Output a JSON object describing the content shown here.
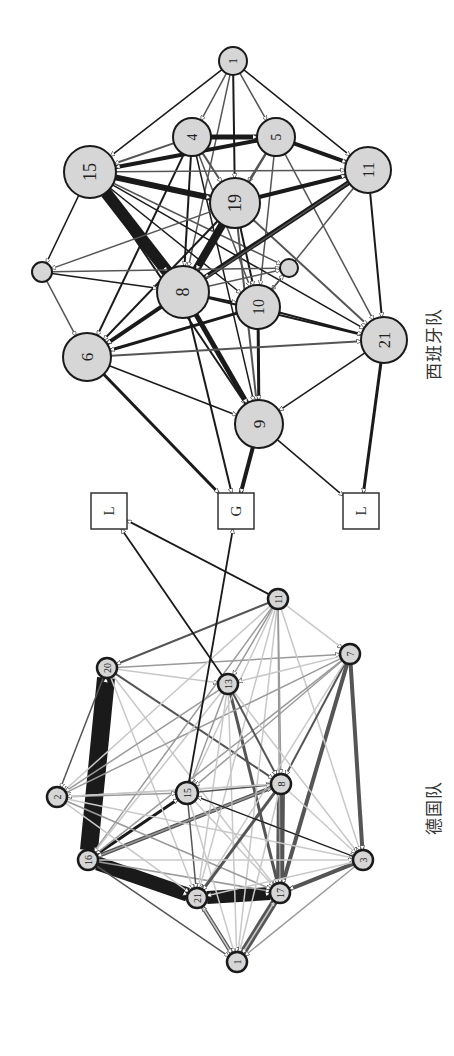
{
  "figure": {
    "orientation": "rotated-90-ccw",
    "colors": {
      "node_fill": "#d6d6d6",
      "node_stroke": "#1a1a1a",
      "box_fill": "#ffffff",
      "edge_dark": "#1a1a1a",
      "edge_mid": "#555555",
      "edge_light": "#9a9a9a",
      "edge_faint": "#c8c8c8"
    }
  },
  "teams": [
    {
      "id": "spain",
      "label": "西班牙队",
      "label_pos": [
        420,
        380
      ],
      "nodes": [
        {
          "id": "s1",
          "label": "1",
          "x": 233,
          "y": 61,
          "r": 14
        },
        {
          "id": "s4",
          "label": "4",
          "x": 192,
          "y": 137,
          "r": 19
        },
        {
          "id": "s5",
          "label": "5",
          "x": 276,
          "y": 137,
          "r": 19
        },
        {
          "id": "s15",
          "label": "15",
          "x": 90,
          "y": 172,
          "r": 26
        },
        {
          "id": "s11",
          "label": "11",
          "x": 368,
          "y": 170,
          "r": 23
        },
        {
          "id": "s19",
          "label": "19",
          "x": 235,
          "y": 203,
          "r": 25
        },
        {
          "id": "sa",
          "label": "",
          "x": 42,
          "y": 272,
          "r": 10
        },
        {
          "id": "sb",
          "label": "",
          "x": 289,
          "y": 268,
          "r": 9
        },
        {
          "id": "s8",
          "label": "8",
          "x": 183,
          "y": 292,
          "r": 26
        },
        {
          "id": "s10",
          "label": "10",
          "x": 258,
          "y": 307,
          "r": 22
        },
        {
          "id": "s6",
          "label": "6",
          "x": 87,
          "y": 357,
          "r": 24
        },
        {
          "id": "s21",
          "label": "21",
          "x": 384,
          "y": 340,
          "r": 23
        },
        {
          "id": "s9",
          "label": "9",
          "x": 259,
          "y": 424,
          "r": 24
        }
      ],
      "edges": [
        [
          "s1",
          "s15",
          1.5,
          "dark"
        ],
        [
          "s1",
          "s4",
          1.5,
          "mid"
        ],
        [
          "s1",
          "s5",
          1.5,
          "mid"
        ],
        [
          "s1",
          "s11",
          1.5,
          "dark"
        ],
        [
          "s1",
          "s19",
          2,
          "dark"
        ],
        [
          "s1",
          "s8",
          1.5,
          "mid"
        ],
        [
          "s4",
          "s5",
          5,
          "dark"
        ],
        [
          "s4",
          "s15",
          2,
          "mid"
        ],
        [
          "s4",
          "s19",
          2,
          "mid"
        ],
        [
          "s4",
          "s8",
          2,
          "dark"
        ],
        [
          "s4",
          "s6",
          2,
          "dark"
        ],
        [
          "s4",
          "s10",
          1.5,
          "mid"
        ],
        [
          "s4",
          "s9",
          1.5,
          "dark"
        ],
        [
          "s5",
          "s11",
          4,
          "dark"
        ],
        [
          "s5",
          "s19",
          2,
          "mid"
        ],
        [
          "s5",
          "s15",
          4,
          "dark"
        ],
        [
          "s5",
          "s8",
          2,
          "mid"
        ],
        [
          "s5",
          "s10",
          1.5,
          "mid"
        ],
        [
          "s5",
          "s21",
          1.5,
          "mid"
        ],
        [
          "s15",
          "s19",
          6,
          "dark"
        ],
        [
          "s15",
          "s8",
          12,
          "dark"
        ],
        [
          "s15",
          "s11",
          1.5,
          "mid"
        ],
        [
          "s15",
          "sa",
          1.5,
          "dark"
        ],
        [
          "s15",
          "s10",
          1.5,
          "dark"
        ],
        [
          "s15",
          "s9",
          2,
          "dark"
        ],
        [
          "s15",
          "s21",
          1.5,
          "dark"
        ],
        [
          "s15",
          "sb",
          1.5,
          "mid"
        ],
        [
          "s19",
          "s11",
          4,
          "dark"
        ],
        [
          "s19",
          "s8",
          8,
          "dark"
        ],
        [
          "s19",
          "s6",
          2,
          "dark"
        ],
        [
          "s19",
          "s10",
          2,
          "dark"
        ],
        [
          "s19",
          "s21",
          2,
          "mid"
        ],
        [
          "s19",
          "s9",
          2,
          "mid"
        ],
        [
          "s19",
          "sa",
          1.5,
          "mid"
        ],
        [
          "s11",
          "s8",
          5,
          "dark"
        ],
        [
          "s11",
          "s6",
          1.5,
          "mid"
        ],
        [
          "s11",
          "s21",
          2,
          "dark"
        ],
        [
          "s11",
          "s10",
          1.5,
          "mid"
        ],
        [
          "sa",
          "s6",
          1.5,
          "mid"
        ],
        [
          "sa",
          "s8",
          1.5,
          "dark"
        ],
        [
          "sa",
          "sb",
          1.5,
          "mid"
        ],
        [
          "s8",
          "s10",
          2,
          "dark"
        ],
        [
          "s8",
          "s6",
          4,
          "dark"
        ],
        [
          "s8",
          "s9",
          5,
          "dark"
        ],
        [
          "s8",
          "s21",
          2,
          "dark"
        ],
        [
          "s8",
          "sb",
          1.5,
          "mid"
        ],
        [
          "s8",
          "G",
          2,
          "dark"
        ],
        [
          "s10",
          "s6",
          3,
          "dark"
        ],
        [
          "s10",
          "s21",
          2,
          "dark"
        ],
        [
          "s10",
          "s9",
          3,
          "dark"
        ],
        [
          "s10",
          "sb",
          1.5,
          "mid"
        ],
        [
          "s6",
          "s21",
          2,
          "mid"
        ],
        [
          "s6",
          "s9",
          1.5,
          "dark"
        ],
        [
          "s6",
          "G",
          3,
          "dark"
        ],
        [
          "s21",
          "s9",
          1.5,
          "dark"
        ],
        [
          "s21",
          "L2",
          3,
          "dark"
        ],
        [
          "s9",
          "G",
          4,
          "dark"
        ],
        [
          "s9",
          "L2",
          1.5,
          "dark"
        ]
      ],
      "boxes": [
        {
          "id": "L1",
          "label": "L",
          "x": 109,
          "y": 511,
          "size": 36
        },
        {
          "id": "G",
          "label": "G",
          "x": 236,
          "y": 511,
          "size": 36
        },
        {
          "id": "L2",
          "label": "L",
          "x": 361,
          "y": 511,
          "size": 36
        }
      ]
    },
    {
      "id": "germany",
      "label": "德国队",
      "label_pos": [
        420,
        835
      ],
      "nodes": [
        {
          "id": "g11",
          "label": "11",
          "x": 278,
          "y": 599,
          "r": 10
        },
        {
          "id": "g20",
          "label": "20",
          "x": 107,
          "y": 668,
          "r": 10
        },
        {
          "id": "g7",
          "label": "7",
          "x": 350,
          "y": 654,
          "r": 10
        },
        {
          "id": "g13",
          "label": "13",
          "x": 228,
          "y": 684,
          "r": 10
        },
        {
          "id": "g2",
          "label": "2",
          "x": 57,
          "y": 797,
          "r": 10
        },
        {
          "id": "g15",
          "label": "15",
          "x": 187,
          "y": 793,
          "r": 11
        },
        {
          "id": "g8",
          "label": "8",
          "x": 281,
          "y": 784,
          "r": 10
        },
        {
          "id": "g16",
          "label": "16",
          "x": 88,
          "y": 860,
          "r": 10
        },
        {
          "id": "g3",
          "label": "3",
          "x": 363,
          "y": 860,
          "r": 10
        },
        {
          "id": "g21",
          "label": "21",
          "x": 197,
          "y": 898,
          "r": 10
        },
        {
          "id": "g17",
          "label": "17",
          "x": 280,
          "y": 893,
          "r": 10
        },
        {
          "id": "g1",
          "label": "1",
          "x": 237,
          "y": 962,
          "r": 10
        }
      ],
      "edges": [
        [
          "g16",
          "g20",
          18,
          "dark"
        ],
        [
          "g16",
          "g21",
          14,
          "dark"
        ],
        [
          "g21",
          "g17",
          13,
          "dark"
        ],
        [
          "g8",
          "g17",
          8,
          "mid"
        ],
        [
          "g1",
          "g17",
          7,
          "mid"
        ],
        [
          "g1",
          "g21",
          4,
          "mid"
        ],
        [
          "g7",
          "g3",
          4,
          "mid"
        ],
        [
          "g7",
          "g17",
          4,
          "mid"
        ],
        [
          "g3",
          "g17",
          4,
          "mid"
        ],
        [
          "g16",
          "g8",
          4,
          "mid"
        ],
        [
          "g13",
          "g17",
          3,
          "mid"
        ],
        [
          "g16",
          "g15",
          3,
          "dark"
        ],
        [
          "g16",
          "g17",
          1.5,
          "light"
        ],
        [
          "g11",
          "g20",
          2,
          "mid"
        ],
        [
          "g20",
          "g2",
          1.5,
          "mid"
        ],
        [
          "g20",
          "g7",
          1.5,
          "light"
        ],
        [
          "g20",
          "g13",
          1.5,
          "faint"
        ],
        [
          "g20",
          "g8",
          2,
          "mid"
        ],
        [
          "g20",
          "g21",
          1.5,
          "faint"
        ],
        [
          "g20",
          "g17",
          1.5,
          "faint"
        ],
        [
          "g11",
          "g7",
          1.5,
          "faint"
        ],
        [
          "g11",
          "g13",
          1.5,
          "light"
        ],
        [
          "g11",
          "g8",
          1.5,
          "light"
        ],
        [
          "g11",
          "g15",
          1.5,
          "faint"
        ],
        [
          "g11",
          "g16",
          1.5,
          "light"
        ],
        [
          "g11",
          "g21",
          1.5,
          "faint"
        ],
        [
          "g11",
          "g17",
          1.5,
          "light"
        ],
        [
          "g11",
          "g2",
          1.5,
          "faint"
        ],
        [
          "g11",
          "g3",
          1.5,
          "faint"
        ],
        [
          "g11",
          "g1",
          1.5,
          "faint"
        ],
        [
          "g7",
          "g13",
          1.5,
          "faint"
        ],
        [
          "g7",
          "g8",
          2,
          "mid"
        ],
        [
          "g7",
          "g15",
          1.5,
          "light"
        ],
        [
          "g7",
          "g16",
          1.5,
          "light"
        ],
        [
          "g7",
          "g2",
          1.5,
          "light"
        ],
        [
          "g7",
          "g21",
          1.5,
          "faint"
        ],
        [
          "g13",
          "g2",
          1.5,
          "light"
        ],
        [
          "g13",
          "g15",
          1.5,
          "light"
        ],
        [
          "g13",
          "g16",
          1.5,
          "faint"
        ],
        [
          "g13",
          "g8",
          2,
          "mid"
        ],
        [
          "g13",
          "g21",
          1.5,
          "faint"
        ],
        [
          "g13",
          "g1",
          1.5,
          "faint"
        ],
        [
          "g13",
          "g3",
          1.5,
          "faint"
        ],
        [
          "g2",
          "g15",
          1.5,
          "light"
        ],
        [
          "g2",
          "g8",
          1.5,
          "faint"
        ],
        [
          "g2",
          "g21",
          1.5,
          "faint"
        ],
        [
          "g2",
          "g17",
          1.5,
          "light"
        ],
        [
          "g2",
          "g3",
          1.5,
          "faint"
        ],
        [
          "g15",
          "g8",
          1.5,
          "mid"
        ],
        [
          "g15",
          "g21",
          1.5,
          "mid"
        ],
        [
          "g15",
          "g17",
          1.5,
          "faint"
        ],
        [
          "g15",
          "g3",
          1.5,
          "faint"
        ],
        [
          "g15",
          "g1",
          1.5,
          "faint"
        ],
        [
          "g8",
          "g21",
          3,
          "mid"
        ],
        [
          "g8",
          "g16",
          1.5,
          "light"
        ],
        [
          "g8",
          "g3",
          1.5,
          "faint"
        ],
        [
          "g8",
          "g1",
          1.5,
          "faint"
        ],
        [
          "g8",
          "g2",
          1.5,
          "faint"
        ],
        [
          "g16",
          "g3",
          1.5,
          "faint"
        ],
        [
          "g16",
          "g1",
          1.5,
          "mid"
        ],
        [
          "g3",
          "g1",
          1.5,
          "light"
        ],
        [
          "g3",
          "g15",
          1.2,
          "dark"
        ],
        [
          "g3",
          "g21",
          1.5,
          "faint"
        ],
        [
          "g21",
          "g1",
          1.5,
          "faint"
        ],
        [
          "g17",
          "g1",
          1.5,
          "faint"
        ]
      ]
    }
  ],
  "cross_edges": [
    [
      "g11",
      "L1",
      1.8,
      "dark"
    ],
    [
      "g13",
      "L1",
      1.8,
      "dark"
    ],
    [
      "g15",
      "G",
      1.8,
      "dark"
    ]
  ]
}
